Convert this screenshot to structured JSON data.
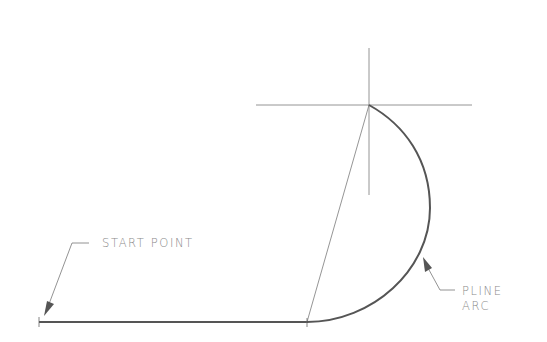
{
  "diagram": {
    "title": "",
    "labels": {
      "start_point": "START POINT",
      "pline_arc_line1": "PLINE",
      "pline_arc_line2": "ARC"
    },
    "elements": {
      "polyline_segment": {
        "from": [
          39,
          322
        ],
        "to": [
          307,
          322
        ],
        "kind": "line"
      },
      "arc": {
        "from": [
          307,
          322
        ],
        "to": [
          369,
          105
        ],
        "kind": "arc",
        "bulge_direction": "right"
      },
      "chord": {
        "from": [
          307,
          322
        ],
        "to": [
          369,
          105
        ]
      },
      "crosshair": {
        "center": [
          369,
          105
        ],
        "h_from": 256,
        "h_to": 472,
        "v_from": 48,
        "v_to": 195
      }
    },
    "colors": {
      "background": "#ffffff",
      "polyline": "#555555",
      "construction": "#777777",
      "text": "#8a8a8a"
    }
  }
}
